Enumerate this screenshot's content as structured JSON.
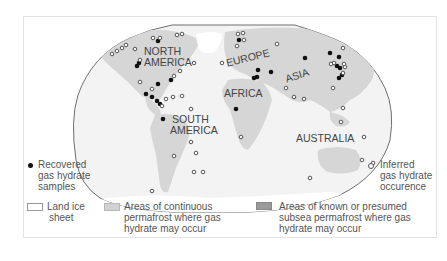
{
  "map": {
    "title": "",
    "continent_labels": {
      "north_america": "NORTH\nAMERICA",
      "north_america_line1": "NORTH",
      "north_america_line2": "AMERICA",
      "south_america_line1": "SOUTH",
      "south_america_line2": "AMERICA",
      "europe": "EUROPE",
      "africa": "AFRICA",
      "asia": "ASIA",
      "australia": "AUSTRALIA"
    },
    "colors": {
      "ocean": "#f4f4f4",
      "land": "#d9d9d9",
      "land_dark": "#c4c4c4",
      "ice": "#ffffff",
      "border": "#777777",
      "recovered_marker": "#111111",
      "inferred_marker_stroke": "#555555",
      "permafrost_swatch": "#d2d2d2",
      "subsea_swatch": "#9a9a9a"
    }
  },
  "legend": {
    "recovered": {
      "line1": "Recovered",
      "line2": "gas hydrate",
      "line3": "samples"
    },
    "inferred": {
      "line1": "Inferred",
      "line2": "gas hydrate",
      "line3": "occurence"
    },
    "land_ice": {
      "line1": "Land ice",
      "line2": "sheet"
    },
    "continuous_permafrost": {
      "line1": "Areas of continuous",
      "line2": "permafrost where gas",
      "line3": "hydrate may occur"
    },
    "subsea_permafrost": {
      "line1": "Areas of known or presumed",
      "line2": "subsea permafrost where gas",
      "line3": "hydrate may occur"
    }
  }
}
